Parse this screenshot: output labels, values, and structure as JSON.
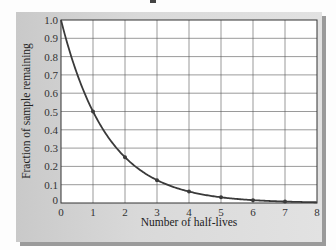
{
  "chart_data": {
    "type": "line",
    "title": "",
    "xlabel": "Number of half-lives",
    "ylabel": "Fraction of sample remaining",
    "x": [
      0,
      1,
      2,
      3,
      4,
      5,
      6,
      7,
      8
    ],
    "series": [
      {
        "name": "Fraction remaining",
        "values": [
          1.0,
          0.5,
          0.25,
          0.125,
          0.0625,
          0.03125,
          0.015625,
          0.0078125,
          0.00390625
        ],
        "markers_at": [
          1,
          2,
          3,
          4,
          5,
          6,
          7
        ],
        "color": "#3a3a3a"
      }
    ],
    "xlim": [
      0,
      8
    ],
    "ylim": [
      0,
      1.0
    ],
    "xticks": [
      "0",
      "1",
      "2",
      "3",
      "4",
      "5",
      "6",
      "7",
      "8"
    ],
    "yticks": [
      "0",
      "0.1",
      "0.2",
      "0.3",
      "0.4",
      "0.5",
      "0.6",
      "0.7",
      "0.8",
      "0.9",
      "1.0"
    ],
    "grid": true,
    "legend": null
  },
  "colors": {
    "panel": "#d6d6d6",
    "plot_bg": "#ffffff",
    "grid": "#555555",
    "curve": "#3a3a3a",
    "shadow": "#9a9a9a"
  }
}
